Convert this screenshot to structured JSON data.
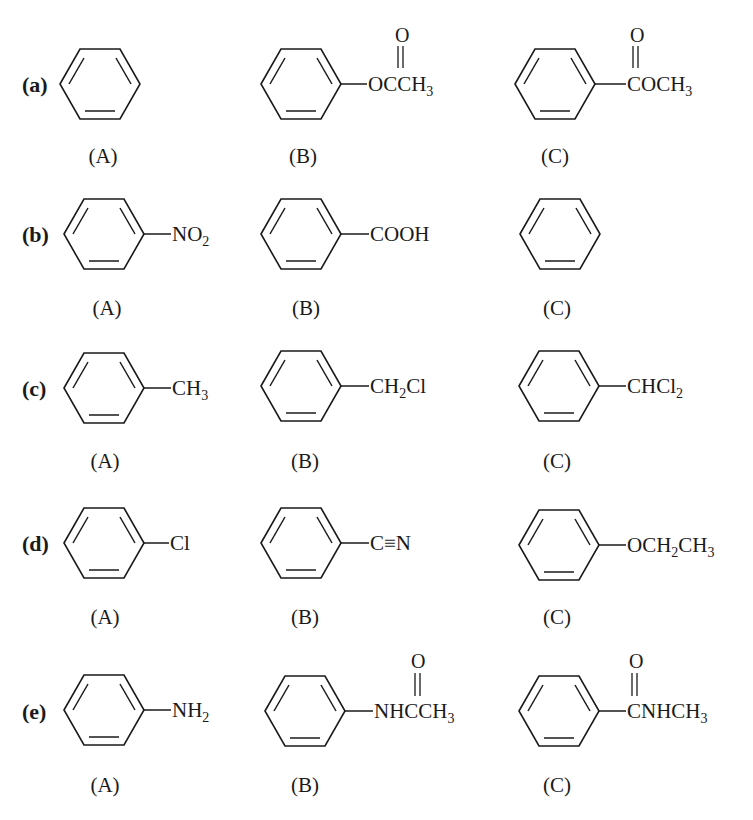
{
  "rows": [
    {
      "label": "(a)",
      "items": [
        {
          "caption": "(A)",
          "substituent": "",
          "name": "benzene"
        },
        {
          "caption": "(B)",
          "substituent": "OCCH3",
          "carbonyl_O": "O",
          "name": "phenyl acetate"
        },
        {
          "caption": "(C)",
          "substituent": "COCH3",
          "carbonyl_O": "O",
          "name": "methyl benzoate"
        }
      ]
    },
    {
      "label": "(b)",
      "items": [
        {
          "caption": "(A)",
          "substituent": "NO2",
          "name": "nitrobenzene"
        },
        {
          "caption": "(B)",
          "substituent": "COOH",
          "name": "benzoic acid"
        },
        {
          "caption": "(C)",
          "substituent": "",
          "name": "benzene"
        }
      ]
    },
    {
      "label": "(c)",
      "items": [
        {
          "caption": "(A)",
          "substituent": "CH3",
          "name": "toluene"
        },
        {
          "caption": "(B)",
          "substituent": "CH2Cl",
          "name": "benzyl chloride"
        },
        {
          "caption": "(C)",
          "substituent": "CHCl2",
          "name": "benzal chloride"
        }
      ]
    },
    {
      "label": "(d)",
      "items": [
        {
          "caption": "(A)",
          "substituent": "Cl",
          "name": "chlorobenzene"
        },
        {
          "caption": "(B)",
          "substituent": "C≡N",
          "name": "benzonitrile"
        },
        {
          "caption": "(C)",
          "substituent": "OCH2CH3",
          "name": "ethoxybenzene"
        }
      ]
    },
    {
      "label": "(e)",
      "items": [
        {
          "caption": "(A)",
          "substituent": "NH2",
          "name": "aniline"
        },
        {
          "caption": "(B)",
          "substituent": "NHCCH3",
          "carbonyl_O": "O",
          "name": "acetanilide"
        },
        {
          "caption": "(C)",
          "substituent": "CNHCH3",
          "carbonyl_O": "O",
          "name": "N-methylbenzamide"
        }
      ]
    }
  ],
  "text": {
    "a_B_main": "OCCH",
    "a_B_sub": "3",
    "a_C_main": "COCH",
    "a_C_sub": "3",
    "b_A_main": "NO",
    "b_A_sub": "2",
    "b_B_main": "COOH",
    "c_A_main": "CH",
    "c_A_sub": "3",
    "c_B_main1": "CH",
    "c_B_sub": "2",
    "c_B_main2": "Cl",
    "c_C_main": "CHCl",
    "c_C_sub": "2",
    "d_A_main": "Cl",
    "d_B_main": "C≡N",
    "d_C_main1": "OCH",
    "d_C_sub1": "2",
    "d_C_main2": "CH",
    "d_C_sub2": "3",
    "e_A_main": "NH",
    "e_A_sub": "2",
    "e_B_main": "NHCCH",
    "e_B_sub": "3",
    "e_C_main": "CNHCH",
    "e_C_sub": "3",
    "O": "O"
  }
}
